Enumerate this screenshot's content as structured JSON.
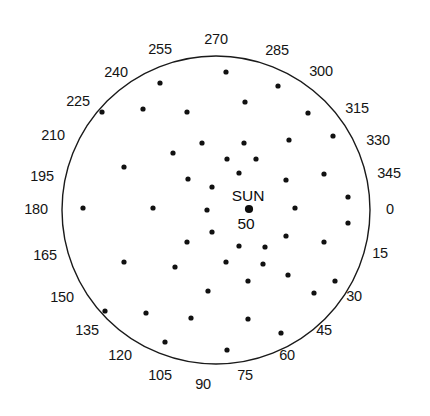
{
  "chart_data": {
    "type": "scatter",
    "projection": "polar",
    "title": "",
    "subtitle": "",
    "xlabel": "",
    "ylabel": "",
    "grid": false,
    "legend": null,
    "center_marker": {
      "name": "SUN",
      "value": "50",
      "x_px": 249,
      "y_px": 209,
      "radius_px": 4.1
    },
    "boundary_circle": {
      "center_x_px": 216,
      "center_y_px": 210,
      "radius_px": 154,
      "stroke": "#1a1a1a",
      "stroke_width": 1.4
    },
    "angular_axis": {
      "units": "degrees",
      "start": 0,
      "step": 15,
      "count": 24,
      "direction": "counterclockwise",
      "zero_at": "east",
      "tick_labels": [
        "0",
        "15",
        "30",
        "45",
        "60",
        "75",
        "90",
        "105",
        "120",
        "135",
        "150",
        "165",
        "180",
        "195",
        "210",
        "225",
        "240",
        "255",
        "270",
        "285",
        "300",
        "315",
        "330",
        "345"
      ]
    },
    "tick_label_positions": [
      {
        "label": "0",
        "x": 390,
        "y": 209
      },
      {
        "label": "15",
        "x": 380,
        "y": 253
      },
      {
        "label": "30",
        "x": 354,
        "y": 296
      },
      {
        "label": "45",
        "x": 324,
        "y": 330
      },
      {
        "label": "60",
        "x": 287,
        "y": 355
      },
      {
        "label": "75",
        "x": 245,
        "y": 375
      },
      {
        "label": "90",
        "x": 203,
        "y": 384
      },
      {
        "label": "105",
        "x": 160,
        "y": 375
      },
      {
        "label": "120",
        "x": 120,
        "y": 355
      },
      {
        "label": "135",
        "x": 87,
        "y": 330
      },
      {
        "label": "150",
        "x": 62,
        "y": 297
      },
      {
        "label": "165",
        "x": 45,
        "y": 255
      },
      {
        "label": "180",
        "x": 36,
        "y": 209
      },
      {
        "label": "195",
        "x": 42,
        "y": 176
      },
      {
        "label": "210",
        "x": 53,
        "y": 135
      },
      {
        "label": "225",
        "x": 78,
        "y": 101
      },
      {
        "label": "240",
        "x": 116,
        "y": 72
      },
      {
        "label": "255",
        "x": 160,
        "y": 49
      },
      {
        "label": "270",
        "x": 216,
        "y": 39
      },
      {
        "label": "285",
        "x": 277,
        "y": 50
      },
      {
        "label": "300",
        "x": 321,
        "y": 71
      },
      {
        "label": "315",
        "x": 357,
        "y": 108
      },
      {
        "label": "330",
        "x": 378,
        "y": 140
      },
      {
        "label": "345",
        "x": 389,
        "y": 173
      }
    ],
    "points_px": [
      {
        "x": 226,
        "y": 72
      },
      {
        "x": 160,
        "y": 83
      },
      {
        "x": 278,
        "y": 86
      },
      {
        "x": 245,
        "y": 102
      },
      {
        "x": 102,
        "y": 112
      },
      {
        "x": 143,
        "y": 109
      },
      {
        "x": 187,
        "y": 112
      },
      {
        "x": 308,
        "y": 113
      },
      {
        "x": 333,
        "y": 136
      },
      {
        "x": 289,
        "y": 140
      },
      {
        "x": 244,
        "y": 143
      },
      {
        "x": 202,
        "y": 143
      },
      {
        "x": 173,
        "y": 153
      },
      {
        "x": 124,
        "y": 167
      },
      {
        "x": 227,
        "y": 159
      },
      {
        "x": 256,
        "y": 159
      },
      {
        "x": 239,
        "y": 173
      },
      {
        "x": 324,
        "y": 174
      },
      {
        "x": 286,
        "y": 180
      },
      {
        "x": 188,
        "y": 179
      },
      {
        "x": 212,
        "y": 187
      },
      {
        "x": 348,
        "y": 197
      },
      {
        "x": 295,
        "y": 208
      },
      {
        "x": 83,
        "y": 208
      },
      {
        "x": 153,
        "y": 208
      },
      {
        "x": 207,
        "y": 210
      },
      {
        "x": 348,
        "y": 223
      },
      {
        "x": 212,
        "y": 232
      },
      {
        "x": 286,
        "y": 236
      },
      {
        "x": 324,
        "y": 242
      },
      {
        "x": 187,
        "y": 242
      },
      {
        "x": 239,
        "y": 246
      },
      {
        "x": 265,
        "y": 247
      },
      {
        "x": 124,
        "y": 262
      },
      {
        "x": 226,
        "y": 262
      },
      {
        "x": 263,
        "y": 264
      },
      {
        "x": 175,
        "y": 267
      },
      {
        "x": 288,
        "y": 275
      },
      {
        "x": 335,
        "y": 281
      },
      {
        "x": 248,
        "y": 281
      },
      {
        "x": 208,
        "y": 291
      },
      {
        "x": 314,
        "y": 293
      },
      {
        "x": 105,
        "y": 311
      },
      {
        "x": 146,
        "y": 313
      },
      {
        "x": 191,
        "y": 318
      },
      {
        "x": 248,
        "y": 319
      },
      {
        "x": 281,
        "y": 333
      },
      {
        "x": 165,
        "y": 342
      },
      {
        "x": 227,
        "y": 350
      }
    ],
    "point_style": {
      "color": "#111111",
      "radius_px": 2.6,
      "marker": "circle-filled"
    }
  }
}
